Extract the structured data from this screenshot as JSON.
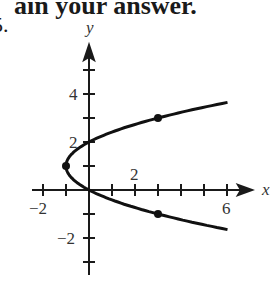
{
  "header": {
    "text": "ain your answer."
  },
  "problem_number": "5.",
  "chart_data": {
    "type": "line",
    "title": "",
    "xlabel": "x",
    "ylabel": "y",
    "equation": "x = y^2 - 2y",
    "xlim": [
      -2,
      6
    ],
    "ylim": [
      -3,
      5
    ],
    "x_tick_labels": [
      "-2",
      "2",
      "6"
    ],
    "y_tick_labels": [
      "4",
      "2",
      "-2"
    ],
    "grid": false,
    "series": [
      {
        "name": "curve",
        "points": [
          [
            6.0,
            -1.65
          ],
          [
            3,
            -1
          ],
          [
            0,
            0
          ],
          [
            -1,
            1
          ],
          [
            0,
            2
          ],
          [
            3,
            3
          ],
          [
            6.0,
            3.65
          ]
        ]
      }
    ],
    "marked_points": [
      [
        -1,
        1
      ],
      [
        3,
        3
      ],
      [
        3,
        -1
      ]
    ]
  }
}
